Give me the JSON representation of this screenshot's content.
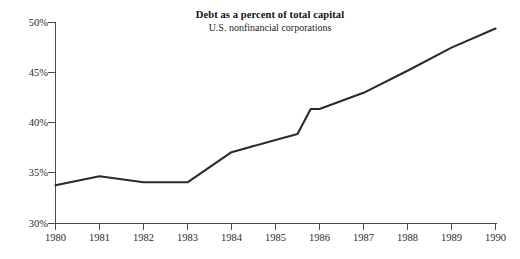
{
  "chart_data": {
    "type": "line",
    "title": "Debt as a percent of total capital",
    "subtitle": "U.S. nonfinancial corporations",
    "xlabel": "",
    "ylabel": "",
    "x": [
      1980,
      1981,
      1982,
      1983,
      1984,
      1985,
      1986,
      1987,
      1988,
      1989,
      1990
    ],
    "values": [
      33.8,
      34.7,
      34.1,
      34.1,
      37.1,
      38.3,
      41.4,
      43.0,
      45.2,
      47.5,
      49.4
    ],
    "series": [
      {
        "name": "Debt as a percent of total capital",
        "values": [
          33.8,
          34.7,
          34.1,
          34.1,
          37.1,
          38.3,
          41.4,
          43.0,
          45.2,
          47.5,
          49.4
        ]
      }
    ],
    "interior_vertices": [
      {
        "x": 1985.5,
        "y": 38.9
      },
      {
        "x": 1985.8,
        "y": 41.4
      }
    ],
    "xlim": [
      1980,
      1990
    ],
    "ylim": [
      30,
      50
    ],
    "ytick_values": [
      30,
      35,
      40,
      45,
      50
    ],
    "ytick_labels": [
      "30%",
      "35%",
      "40%",
      "45%",
      "50%"
    ],
    "xtick_values": [
      1980,
      1981,
      1982,
      1983,
      1984,
      1985,
      1986,
      1987,
      1988,
      1989,
      1990
    ],
    "xtick_labels": [
      "1980",
      "1981",
      "1982",
      "1983",
      "1984",
      "1985",
      "1986",
      "1987",
      "1988",
      "1989",
      "1990"
    ],
    "grid": false,
    "legend": false,
    "line_color": "#2b2b2b",
    "axis_color": "#4a4a4a",
    "background_color": "#ffffff"
  }
}
